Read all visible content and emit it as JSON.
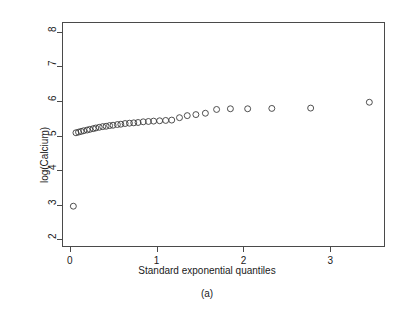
{
  "figure": {
    "caption": "(a)",
    "background": "#ffffff",
    "frame_color": "#4a4a4a",
    "point_color": "#3a3a3a"
  },
  "chart_data": {
    "type": "scatter",
    "title": "",
    "xlabel": "Standard exponential quantiles",
    "ylabel": "log(Calcium)",
    "xlim": [
      -0.09,
      3.63
    ],
    "ylim": [
      1.78,
      8.28
    ],
    "xticks": [
      0,
      1,
      2,
      3
    ],
    "xticklabels": [
      "0",
      "1",
      "2",
      "3"
    ],
    "yticks": [
      2,
      3,
      4,
      5,
      6,
      7,
      8
    ],
    "yticklabels": [
      "2",
      "3",
      "4",
      "5",
      "6",
      "7",
      "8"
    ],
    "grid": false,
    "legend": null,
    "marker": "open-circle",
    "marker_size_px": 4.2,
    "x": [
      0.03,
      0.06,
      0.09,
      0.12,
      0.15,
      0.19,
      0.22,
      0.26,
      0.29,
      0.33,
      0.37,
      0.41,
      0.45,
      0.49,
      0.54,
      0.58,
      0.63,
      0.68,
      0.73,
      0.78,
      0.84,
      0.9,
      0.96,
      1.03,
      1.1,
      1.17,
      1.26,
      1.35,
      1.45,
      1.56,
      1.69,
      1.85,
      2.05,
      2.33,
      2.78,
      3.46
    ],
    "y": [
      2.94,
      5.08,
      5.1,
      5.12,
      5.14,
      5.16,
      5.18,
      5.2,
      5.22,
      5.24,
      5.26,
      5.27,
      5.29,
      5.3,
      5.32,
      5.33,
      5.35,
      5.36,
      5.37,
      5.38,
      5.4,
      5.41,
      5.42,
      5.43,
      5.44,
      5.45,
      5.52,
      5.58,
      5.61,
      5.65,
      5.76,
      5.78,
      5.78,
      5.79,
      5.8,
      5.97
    ],
    "outlier": {
      "x": 0.03,
      "y": 2.94,
      "note": "low extreme value"
    },
    "n_points": 36
  }
}
